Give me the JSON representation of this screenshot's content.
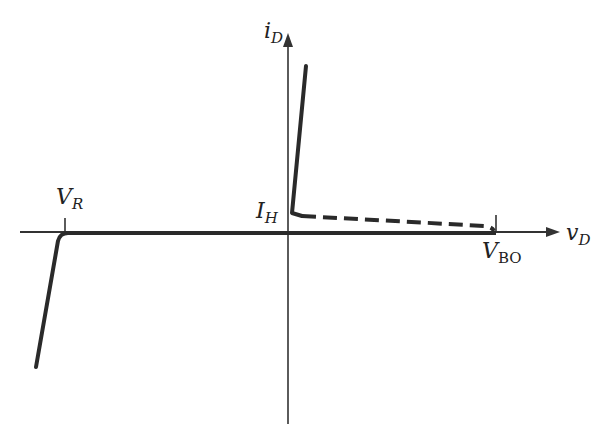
{
  "diagram": {
    "colors": {
      "line": "#2a2a2a",
      "axis": "#333333",
      "background": "#ffffff"
    },
    "axes": {
      "x_label": {
        "main": "v",
        "sub": "D"
      },
      "y_label": {
        "main": "i",
        "sub": "D"
      }
    },
    "labels": {
      "reverse_breakdown": {
        "main": "V",
        "sub": "R"
      },
      "holding_current": {
        "main": "I",
        "sub": "H"
      },
      "breakover_voltage": {
        "main": "V",
        "sub": "BO"
      }
    },
    "curves": [
      {
        "name": "reverse-breakdown-branch",
        "style": "solid"
      },
      {
        "name": "off-state-leakage",
        "style": "solid"
      },
      {
        "name": "negative-resistance-transition",
        "style": "dashed"
      },
      {
        "name": "on-state-branch",
        "style": "solid"
      }
    ]
  }
}
